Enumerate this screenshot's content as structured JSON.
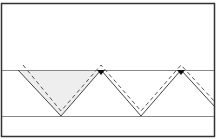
{
  "diagram": {
    "type": "zigzag-seam-pattern",
    "colors": {
      "frame": "#333333",
      "band_line": "#888888",
      "solid_line": "#444444",
      "dashed_line": "#555555",
      "shaded_fill": "#eeeeee",
      "marker": "#111111"
    },
    "frame": {
      "x": 1.5,
      "y": 3.5,
      "width": 213,
      "height": 133
    },
    "band": {
      "top_y": 70.5,
      "bottom_y": 116.5
    },
    "zigzag_points": [
      [
        18,
        70
      ],
      [
        61,
        116
      ],
      [
        101,
        70
      ],
      [
        141,
        116
      ],
      [
        181,
        70
      ],
      [
        215,
        107
      ]
    ],
    "shaded_triangle": [
      [
        18,
        70
      ],
      [
        101,
        70
      ],
      [
        61,
        116
      ]
    ],
    "markers": [
      [
        101,
        70
      ],
      [
        181,
        70
      ]
    ]
  }
}
